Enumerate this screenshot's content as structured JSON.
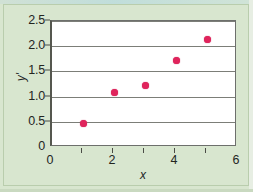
{
  "chart_data": {
    "type": "scatter",
    "title": "",
    "xlabel": "x",
    "ylabel": "y'",
    "x": [
      1,
      2,
      3,
      4,
      5
    ],
    "values": [
      0.47,
      1.08,
      1.23,
      1.72,
      2.13
    ],
    "points": [
      {
        "x": 1,
        "y": 0.47
      },
      {
        "x": 2,
        "y": 1.08
      },
      {
        "x": 3,
        "y": 1.23
      },
      {
        "x": 4,
        "y": 1.72
      },
      {
        "x": 5,
        "y": 2.13
      }
    ],
    "xlim": [
      0,
      6
    ],
    "ylim": [
      0,
      2.5
    ],
    "xticks": [
      0,
      2,
      4,
      6
    ],
    "xtick_labels": [
      "0",
      "2",
      "4",
      "6"
    ],
    "xtick_minor": [
      1,
      3,
      5
    ],
    "yticks": [
      0,
      0.5,
      1.0,
      1.5,
      2.0,
      2.5
    ],
    "ytick_labels": [
      "0",
      "0.5",
      "1.0",
      "1.5",
      "2.0",
      "2.5"
    ],
    "grid": "horizontal",
    "legend": "none",
    "marker_color": "#e0245c",
    "plot_background": "#ffffff",
    "figure_background": "#d8e6cf",
    "gridline_color": "#7c7e78",
    "axis_color": "#55574f"
  }
}
